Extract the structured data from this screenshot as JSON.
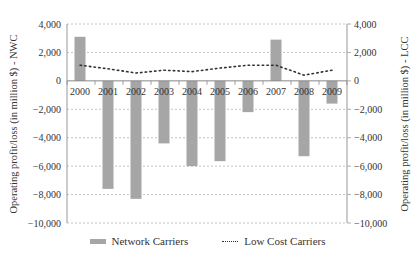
{
  "chart_data": {
    "type": "bar",
    "title": "",
    "categories": [
      "2000",
      "2001",
      "2002",
      "2003",
      "2004",
      "2005",
      "2006",
      "2007",
      "2008",
      "2009"
    ],
    "series": [
      {
        "name": "Network Carriers",
        "type": "bar",
        "axis": "left",
        "color": "#a6a6a6",
        "values": [
          3100,
          -7600,
          -8300,
          -4400,
          -6000,
          -5650,
          -2200,
          2900,
          -5300,
          -1600
        ]
      },
      {
        "name": "Low Cost Carriers",
        "type": "line",
        "style": "dotted",
        "axis": "right",
        "color": "#333333",
        "values": [
          1100,
          850,
          550,
          750,
          650,
          900,
          1100,
          1100,
          400,
          750
        ]
      }
    ],
    "ylabel_left": "Operating profit/loss (in million $) - NWC",
    "ylabel_right": "Operating profit/loss (in million $) - LCC",
    "ylim": [
      -10000,
      4000
    ],
    "yticks": [
      4000,
      2000,
      0,
      -2000,
      -4000,
      -6000,
      -8000,
      -10000
    ],
    "ytick_labels": [
      "4,000",
      "2,000",
      "0",
      "−2,000",
      "−4,000",
      "−6,000",
      "−8,000",
      "−10,000"
    ],
    "grid": true,
    "legend_position": "bottom"
  },
  "legend": {
    "network": "Network Carriers",
    "lcc": "Low Cost Carriers"
  }
}
